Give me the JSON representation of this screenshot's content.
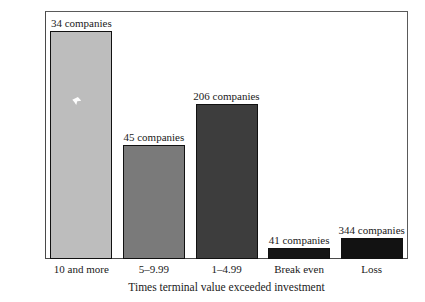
{
  "chart_data": {
    "type": "bar",
    "title": "",
    "subtitle": "",
    "xlabel": "Times terminal value exceeded investment",
    "ylabel": "",
    "categories": [
      "10 and more",
      "5–9.99",
      "1–4.99",
      "Break even",
      "Loss"
    ],
    "values": [
      460,
      230,
      312,
      22,
      42
    ],
    "point_labels": [
      "34 companies",
      "45 companies",
      "206 companies",
      "41 companies",
      "344 companies"
    ],
    "bar_colors": [
      "#bdbdbd",
      "#7a7a7a",
      "#3d3d3d",
      "#161616",
      "#121212"
    ],
    "bar_edge_color": "#111111",
    "ylim": [
      0,
      500
    ],
    "yticks": [
      0,
      100,
      200,
      300,
      400,
      500
    ],
    "ytick_labels": [
      "0",
      "100",
      "200",
      "300",
      "400",
      "500"
    ],
    "grid": false,
    "legend": "none",
    "axis_color": "#4a4a4a",
    "background": "#ffffff"
  },
  "axes": {
    "x_title": "Times terminal value exceeded investment"
  }
}
